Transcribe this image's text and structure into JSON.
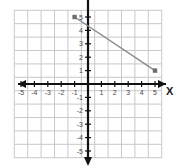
{
  "graph": {
    "title": "",
    "axis_labels": {
      "x": "X",
      "y": ""
    },
    "colors": {
      "background": "#ffffff",
      "grid": "#c8c8c8",
      "axis": "#111111",
      "line": "#8a8a8a",
      "point": "#6e6e6e",
      "tick_label": "#4a4a4a"
    }
  },
  "chart_data": {
    "type": "line",
    "title": "",
    "xlabel": "X",
    "ylabel": "",
    "xlim": [
      -5.5,
      5.5
    ],
    "ylim": [
      -5.5,
      5.5
    ],
    "grid": true,
    "legend": "none",
    "x_ticks": [
      -5,
      -4,
      -3,
      -2,
      -1,
      1,
      2,
      3,
      4,
      5
    ],
    "y_ticks": [
      5,
      4,
      3,
      2,
      1,
      -1,
      -2,
      -3,
      -4,
      -5
    ],
    "x_tick_labels": [
      "-5",
      "-4",
      "-3",
      "-2",
      "-1",
      "1",
      "2",
      "3",
      "4",
      "5"
    ],
    "y_tick_labels": [
      "5",
      "4",
      "3",
      "2",
      "1",
      "-1",
      "-2",
      "-3",
      "-4",
      "-5"
    ],
    "series": [
      {
        "name": "segment",
        "type": "segment",
        "points": [
          {
            "x": -1,
            "y": 5
          },
          {
            "x": 5,
            "y": 1
          }
        ],
        "marker": "square",
        "slope": -0.6667,
        "y_intercept": 4.3333
      }
    ]
  }
}
